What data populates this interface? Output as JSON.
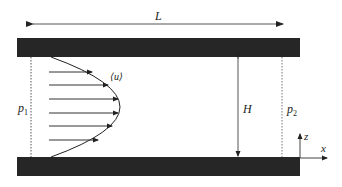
{
  "diagram": {
    "labels": {
      "length": "L",
      "height": "H",
      "mean_velocity": "⟨u⟩",
      "inlet_pressure_base": "p",
      "inlet_pressure_sub": "1",
      "outlet_pressure_base": "p",
      "outlet_pressure_sub": "2",
      "axis_x": "x",
      "axis_z": "z"
    },
    "colors": {
      "plate": "#262626",
      "line": "#444444",
      "text": "#222222"
    },
    "velocity_arrow_count": 6
  }
}
